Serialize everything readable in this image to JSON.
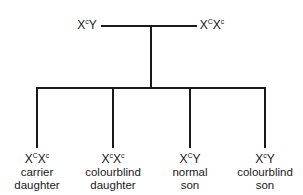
{
  "diagram": {
    "type": "inheritance-pedigree",
    "parents": {
      "father": {
        "genotype": {
          "parts": [
            {
              "base": "X",
              "sup": "c"
            },
            {
              "base": "Y",
              "sup": ""
            }
          ]
        }
      },
      "mother": {
        "genotype": {
          "parts": [
            {
              "base": "X",
              "sup": "C"
            },
            {
              "base": "X",
              "sup": "c"
            }
          ]
        }
      }
    },
    "offspring": [
      {
        "genotype": {
          "parts": [
            {
              "base": "X",
              "sup": "C"
            },
            {
              "base": "X",
              "sup": "c"
            }
          ]
        },
        "line1": "carrier",
        "line2": "daughter"
      },
      {
        "genotype": {
          "parts": [
            {
              "base": "X",
              "sup": "c"
            },
            {
              "base": "X",
              "sup": "c"
            }
          ]
        },
        "line1": "colourblind",
        "line2": "daughter"
      },
      {
        "genotype": {
          "parts": [
            {
              "base": "X",
              "sup": "C"
            },
            {
              "base": "Y",
              "sup": ""
            }
          ]
        },
        "line1": "normal",
        "line2": "son"
      },
      {
        "genotype": {
          "parts": [
            {
              "base": "X",
              "sup": "c"
            },
            {
              "base": "Y",
              "sup": ""
            }
          ]
        },
        "line1": "colourblind",
        "line2": "son"
      }
    ]
  }
}
